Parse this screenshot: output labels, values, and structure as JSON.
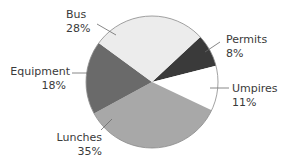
{
  "chart_data": {
    "type": "pie",
    "title": "",
    "categories": [
      "Permits",
      "Umpires",
      "Lunches",
      "Equipment",
      "Bus"
    ],
    "values": [
      8,
      11,
      35,
      18,
      28
    ],
    "unit": "%",
    "colors": [
      "#3a3a3a",
      "#ffffff",
      "#a8a8a8",
      "#6a6a6a",
      "#ececec"
    ],
    "start_angle_deg_clockwise_from_top": 47,
    "legend": "none (direct labels with leader lines)",
    "labels": [
      {
        "name": "Bus",
        "value_text": "28%"
      },
      {
        "name": "Permits",
        "value_text": "8%"
      },
      {
        "name": "Umpires",
        "value_text": "11%"
      },
      {
        "name": "Equipment",
        "value_text": "18%"
      },
      {
        "name": "Lunches",
        "value_text": "35%"
      }
    ]
  },
  "style": {
    "outline_color": "#8a8a8a",
    "leader_color": "#6a6a6a",
    "text_color": "#3a3a3a"
  }
}
